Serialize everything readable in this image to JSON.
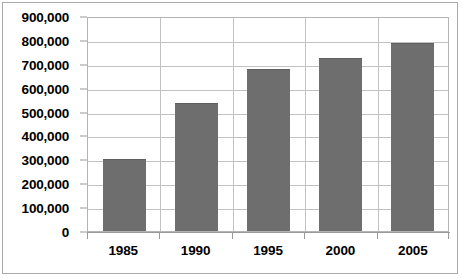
{
  "chart_data": {
    "type": "bar",
    "title": "",
    "subtitle": "",
    "xlabel": "",
    "ylabel": "",
    "categories": [
      "1985",
      "1990",
      "1995",
      "2000",
      "2005"
    ],
    "values": [
      300000,
      535000,
      680000,
      725000,
      785000
    ],
    "series": [
      {
        "name": "",
        "values": [
          300000,
          535000,
          680000,
          725000,
          785000
        ]
      }
    ],
    "ylim": [
      0,
      900000
    ],
    "ytick_step": 100000,
    "ytick_values": [
      0,
      100000,
      200000,
      300000,
      400000,
      500000,
      600000,
      700000,
      800000,
      900000
    ],
    "ytick_labels": [
      "0",
      "100,000",
      "200,000",
      "300,000",
      "400,000",
      "500,000",
      "600,000",
      "700,000",
      "800,000",
      "900,000"
    ],
    "grid": true,
    "grid_axis": "both",
    "legend": false,
    "legend_position": "none",
    "bar_color": "#6e6e6e",
    "gridline_color": "#c2c2c2",
    "plot_background": "#ffffff",
    "frame_color": "#a9a9a9",
    "axis_color": "#9a9a9a",
    "text_color": "#000000",
    "annotations": []
  }
}
